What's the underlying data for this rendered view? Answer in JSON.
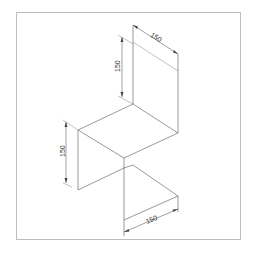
{
  "drawing": {
    "type": "isometric technical drawing",
    "frame_color": "#bdbdbd",
    "line_color": "#555555",
    "dimensions": {
      "top_width": "150",
      "top_height": "150",
      "left_height": "150",
      "bottom_width": "150"
    }
  }
}
